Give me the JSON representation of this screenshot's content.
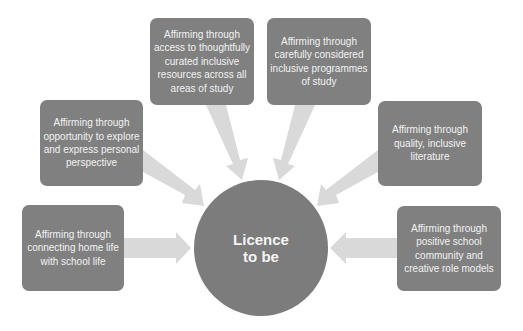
{
  "diagram": {
    "type": "hub-and-spoke",
    "colors": {
      "box_fill": "#808080",
      "hub_fill": "#7c7c7c",
      "arrow_fill": "#d9d9d9",
      "text": "#f2f2f2",
      "background": "#ffffff"
    },
    "hub": {
      "label": "Licence\nto be"
    },
    "spokes": [
      {
        "id": "home-life",
        "position": "bottom-left",
        "label": "Affirming through\nconnecting home life\nwith school life"
      },
      {
        "id": "personal-perspective",
        "position": "middle-left",
        "label": "Affirming through\nopportunity to explore\nand express personal\nperspective"
      },
      {
        "id": "curated-resources",
        "position": "top-left",
        "label": "Affirming through\naccess to thoughtfully\ncurated inclusive\nresources across all\nareas of study"
      },
      {
        "id": "programmes-of-study",
        "position": "top-right",
        "label": "Affirming through\ncarefully considered\ninclusive programmes\nof study"
      },
      {
        "id": "inclusive-literature",
        "position": "middle-right",
        "label": "Affirming through\nquality, inclusive\nliterature"
      },
      {
        "id": "role-models",
        "position": "bottom-right",
        "label": "Affirming through\npositive school\ncommunity and\ncreative role models"
      }
    ]
  }
}
